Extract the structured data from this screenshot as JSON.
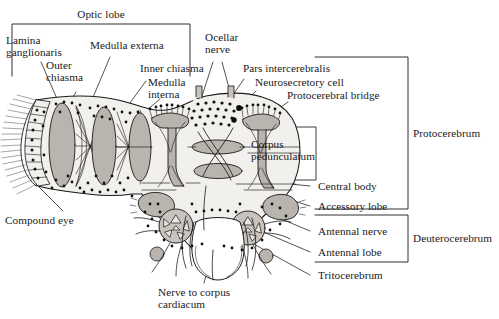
{
  "figure": {
    "width": 499,
    "height": 319,
    "background_color": "#ffffff",
    "ink_color": "#1a1a1a",
    "tissue_fill": "#f2f0ed",
    "neuropil_fill": "#b9b4ae",
    "neuropil_fill_light": "#c8c3bd"
  },
  "labels": {
    "optic_lobe": "Optic lobe",
    "lamina_ganglionaris": "Lamina\nganglionaris",
    "outer_chiasma": "Outer\nchiasma",
    "medulla_externa": "Medulla externa",
    "inner_chiasma": "Inner chiasma",
    "medulla_interna": "Medulla\ninterna",
    "ocellar_nerve": "Ocellar\nnerve",
    "pars_intercerebralis": "Pars intercerebralis",
    "neurosecretory_cell": "Neurosecretory cell",
    "protocerebral_bridge": "Protocerebral bridge",
    "corpus_pedunculatum": "Corpus\npedunculatum",
    "central_body": "Central body",
    "accessory_lobe": "Accessory lobe",
    "antennal_nerve": "Antennal nerve",
    "antennal_lobe": "Antennal lobe",
    "tritocerebrum": "Tritocerebrum",
    "compound_eye": "Compound eye",
    "nerve_to_corpus_cardiacum": "Nerve to corpus\ncardiacum",
    "protocerebrum": "Protocerebrum",
    "deuterocerebrum": "Deuterocerebrum"
  },
  "brackets": [
    {
      "name": "optic-lobe-bracket",
      "label": "Optic lobe",
      "orientation": "top",
      "x1": 12,
      "x2": 190,
      "y": 24,
      "depth": 52
    },
    {
      "name": "protocerebrum-bracket",
      "label": "Protocerebrum",
      "orientation": "right",
      "x": 315,
      "y1": 57,
      "y2": 209,
      "arm": 60
    },
    {
      "name": "deuterocerebrum-bracket",
      "label": "Deuterocerebrum",
      "orientation": "right",
      "x": 315,
      "y1": 215,
      "y2": 262,
      "arm": 60
    },
    {
      "name": "corpus-pedunculatum-box",
      "label": "Corpus pedunculatum",
      "orientation": "box",
      "x": 245,
      "y": 127,
      "w": 71,
      "h": 53
    }
  ],
  "regions": [
    {
      "name": "compound-eye",
      "kind": "ommatidia-fan"
    },
    {
      "name": "lamina-ganglionaris",
      "kind": "neuropil-band"
    },
    {
      "name": "outer-chiasma",
      "kind": "crossing-fibers"
    },
    {
      "name": "medulla-externa",
      "kind": "neuropil-lobe"
    },
    {
      "name": "inner-chiasma",
      "kind": "crossing-fibers"
    },
    {
      "name": "medulla-interna",
      "kind": "neuropil-lobe"
    },
    {
      "name": "ocellar-nerve",
      "kind": "paired-nerve-stalk",
      "count": 2
    },
    {
      "name": "pars-intercerebralis",
      "kind": "cell-body-cluster"
    },
    {
      "name": "neurosecretory-cell",
      "kind": "dark-soma"
    },
    {
      "name": "protocerebral-bridge",
      "kind": "transverse-neuropil"
    },
    {
      "name": "corpus-pedunculatum",
      "kind": "mushroom-body",
      "count": 2
    },
    {
      "name": "central-body",
      "kind": "midline-neuropil"
    },
    {
      "name": "accessory-lobe",
      "kind": "neuropil-lobe",
      "count": 2
    },
    {
      "name": "antennal-lobe",
      "kind": "glomerular-lobe",
      "count": 2
    },
    {
      "name": "antennal-nerve",
      "kind": "nerve-trunk",
      "count": 2
    },
    {
      "name": "tritocerebrum",
      "kind": "ventral-neuropil"
    },
    {
      "name": "esophageal-foramen",
      "kind": "midline-opening"
    },
    {
      "name": "nerve-to-corpus-cardiacum",
      "kind": "efferent-nerve"
    }
  ],
  "leaders": [
    {
      "from": "lamina_ganglionaris",
      "x1": 41,
      "y1": 62,
      "x2": 58,
      "y2": 101
    },
    {
      "from": "outer_chiasma",
      "x1": 76,
      "y1": 90,
      "x2": 69,
      "y2": 104
    },
    {
      "from": "medulla_externa",
      "x1": 110,
      "y1": 55,
      "x2": 86,
      "y2": 113
    },
    {
      "from": "inner_chiasma",
      "x1": 146,
      "y1": 79,
      "x2": 118,
      "y2": 117
    },
    {
      "from": "medulla_interna",
      "x1": 160,
      "y1": 97,
      "x2": 133,
      "y2": 120
    },
    {
      "from": "ocellar_nerve",
      "x1": 212,
      "y1": 60,
      "x2": 200,
      "y2": 99
    },
    {
      "from": "pars_intercerebralis",
      "x1": 244,
      "y1": 77,
      "x2": 213,
      "y2": 120
    },
    {
      "from": "neurosecretory_cell",
      "x1": 257,
      "y1": 89,
      "x2": 238,
      "y2": 107
    },
    {
      "from": "protocerebral_bridge",
      "x1": 289,
      "y1": 100,
      "x2": 246,
      "y2": 130
    },
    {
      "from": "central_body",
      "x1": 312,
      "y1": 186,
      "x2": 270,
      "y2": 182
    },
    {
      "from": "accessory_lobe",
      "x1": 312,
      "y1": 206,
      "x2": 277,
      "y2": 196
    },
    {
      "from": "antennal_nerve",
      "x1": 312,
      "y1": 231,
      "x2": 268,
      "y2": 214
    },
    {
      "from": "antennal_lobe",
      "x1": 312,
      "y1": 252,
      "x2": 262,
      "y2": 232
    },
    {
      "from": "tritocerebrum",
      "x1": 312,
      "y1": 275,
      "x2": 252,
      "y2": 243
    },
    {
      "from": "compound_eye",
      "x1": 63,
      "y1": 213,
      "x2": 36,
      "y2": 186
    },
    {
      "from": "nerve_to_corpus_cardiacum",
      "x1": 204,
      "y1": 285,
      "x2": 213,
      "y2": 252
    }
  ]
}
